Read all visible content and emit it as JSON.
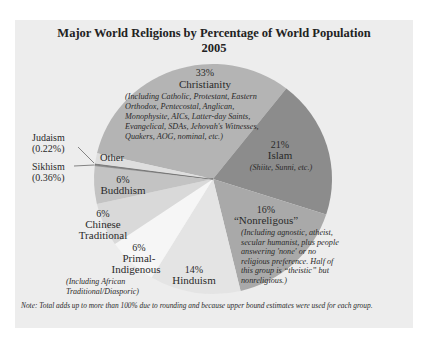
{
  "chart_data": {
    "type": "pie",
    "title": "Major World Religions by Percentage of World Population",
    "subtitle": "2005",
    "note": "Note: Total adds up to more than 100% due to rounding and because upper bound estimates were used for each group.",
    "slices": [
      {
        "name": "Christianity",
        "value": 33,
        "label_pct": "33%",
        "detail": [
          "(Including Catholic, Protestant, Eastern",
          "Orthodox, Pentecostal, Anglican,",
          "Monophysite, AICs, Latter-day Saints,",
          "Evangelical, SDAs, Jehovah's Witnesses,",
          "Quakers, AOG, nominal, etc.)"
        ],
        "color": "#b4b4b4",
        "start": -77.1,
        "end": 38
      },
      {
        "name": "Islam",
        "value": 21,
        "label_pct": "21%",
        "detail": [
          "(Shiite, Sunni, etc.)"
        ],
        "color": "#8c8c8c",
        "start": 38,
        "end": 108
      },
      {
        "name": "“Nonreligous”",
        "value": 16,
        "label_pct": "16%",
        "detail": [
          "(Including agnostic, atheist,",
          "secular humanist, plus people",
          "answering 'none' or no",
          "religious preference. Half of",
          "this group is “theistic” but",
          "nonreligious.)"
        ],
        "color": "#a9a9a9",
        "start": 108,
        "end": 166.6
      },
      {
        "name": "Hinduism",
        "value": 14,
        "label_pct": "14%",
        "detail": [],
        "color": "#e4e4e4",
        "start": 166.6,
        "end": 211
      },
      {
        "name": "Primal-Indigenous",
        "value": 6,
        "label_pct": "6%",
        "detail": [
          "(Including African",
          "Traditional/Diasporic)"
        ],
        "color": "#f6f6f6",
        "start": 211,
        "end": 235.5
      },
      {
        "name": "Chinese Traditional",
        "value": 6,
        "label_pct": "6%",
        "detail": [],
        "color": "#d9d9d9",
        "start": 235.5,
        "end": 257.4
      },
      {
        "name": "Buddhism",
        "value": 6,
        "label_pct": "6%",
        "detail": [],
        "color": "#c3c3c3",
        "start": 257.4,
        "end": 276.7
      },
      {
        "name": "Sikhism",
        "value": 0.36,
        "label_pct": "(0.36%)",
        "detail": [],
        "color": "#9a9a9a",
        "start": 276.7,
        "end": 277.3
      },
      {
        "name": "Judaism",
        "value": 0.22,
        "label_pct": "(0.22%)",
        "detail": [],
        "color": "#9a9a9a",
        "start": 277.3,
        "end": 277.7
      },
      {
        "name": "Other",
        "value": null,
        "label_pct": "",
        "detail": [],
        "color": "#dedede",
        "start": 277.7,
        "end": 282.9
      }
    ],
    "legend_position": "none",
    "labels": {
      "christianity_pct": "33%",
      "christianity": "Christianity",
      "islam_pct": "21%",
      "islam": "Islam",
      "nonrel_pct": "16%",
      "nonrel": "“Nonreligous”",
      "hindu_pct": "14%",
      "hindu": "Hinduism",
      "primal_pct": "6%",
      "primal_1": "Primal-",
      "primal_2": "Indigenous",
      "chinese_pct": "6%",
      "chinese_1": "Chinese",
      "chinese_2": "Traditional",
      "buddhism_pct": "6%",
      "buddhism": "Buddhism",
      "other": "Other",
      "judaism": "Judaism",
      "judaism_pct": "(0.22%)",
      "sikhism": "Sikhism",
      "sikhism_pct": "(0.36%)"
    }
  }
}
